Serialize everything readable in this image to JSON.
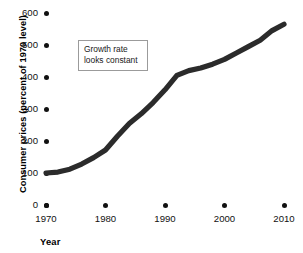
{
  "chart_data": {
    "type": "line",
    "title": "",
    "xlabel": "Year",
    "ylabel": "Consumer prices (percent of 1970 level)",
    "xlim": [
      1970,
      2010
    ],
    "ylim": [
      0,
      600
    ],
    "grid": false,
    "legend": "none",
    "x_ticks": [
      "1970",
      "1980",
      "1990",
      "2000",
      "2010"
    ],
    "y_ticks": [
      "0",
      "100",
      "200",
      "300",
      "400",
      "500",
      "600"
    ],
    "line_color": "#2b2b2b",
    "series": [
      {
        "name": "Consumer prices",
        "x": [
          1970,
          1972,
          1974,
          1976,
          1978,
          1980,
          1982,
          1984,
          1986,
          1988,
          1990,
          1992,
          1994,
          1996,
          1998,
          2000,
          2002,
          2004,
          2006,
          2008,
          2010
        ],
        "values": [
          100,
          103,
          112,
          128,
          148,
          172,
          215,
          255,
          285,
          320,
          360,
          405,
          420,
          428,
          440,
          455,
          475,
          495,
          515,
          545,
          565
        ]
      }
    ],
    "annotations": [
      {
        "name": "growth-rate-note",
        "lines": [
          "Growth rate",
          "looks constant"
        ],
        "border_color": "#9b9b9b",
        "background": "#ffffff"
      }
    ]
  },
  "axis": {
    "y_title": "Consumer prices (percent of 1970 level)",
    "x_title": "Year"
  }
}
